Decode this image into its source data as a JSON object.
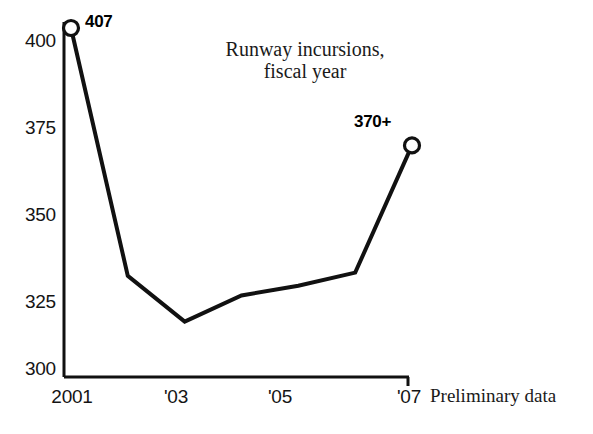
{
  "chart_data": {
    "type": "line",
    "title": "Runway incursions,",
    "title_line2": "fiscal year",
    "xlabel": "",
    "ylabel": "",
    "x": [
      2001,
      2002,
      2003,
      2004,
      2005,
      2006,
      2007
    ],
    "categories": [
      "2001",
      "2002",
      "2003",
      "2004",
      "2005",
      "2006",
      "2007"
    ],
    "values": [
      407,
      331,
      317,
      325,
      328,
      332,
      371
    ],
    "ylim": [
      300,
      410
    ],
    "xlim": [
      2001,
      2007
    ],
    "yticks": [
      300,
      325,
      350,
      375,
      400
    ],
    "ytick_labels": [
      "300",
      "325",
      "350",
      "375",
      "400"
    ],
    "xtick_positions": [
      2001,
      2003,
      2005,
      2007
    ],
    "xtick_labels": [
      "2001",
      "'03",
      "'05",
      "'07"
    ],
    "grid": false,
    "legend": "none",
    "annotations": [
      {
        "point_index": 0,
        "text": "407",
        "x": 2001,
        "y": 407
      },
      {
        "point_index": 6,
        "text": "370+",
        "x": 2007,
        "y": 371
      }
    ],
    "markers": [
      {
        "x": 2001,
        "y": 407,
        "style": "open-circle"
      },
      {
        "x": 2007,
        "y": 371,
        "style": "open-circle"
      }
    ],
    "footnote": "Preliminary data",
    "line_color": "#111111",
    "marker_fill": "#ffffff",
    "axis_color": "#111111"
  }
}
